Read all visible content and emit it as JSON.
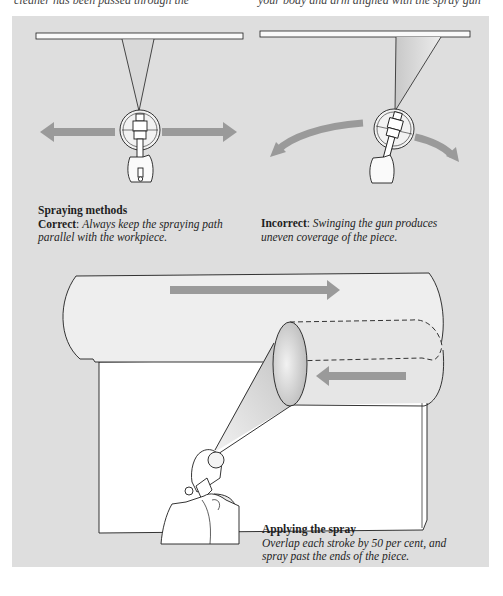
{
  "page_top": {
    "left_fragment": "cleaner has been passed through the",
    "right_fragment": "your body and arm aligned with the spray gun"
  },
  "colors": {
    "panel_bg": "#dedede",
    "arrow": "#9a9a9a",
    "outline": "#1e1e1e",
    "workpiece": "#f4f4f4"
  },
  "figures": {
    "correct": {
      "heading": "Spraying methods",
      "label": "Correct",
      "separator": ":",
      "text": "Always keep the spraying path parallel with the workpiece."
    },
    "incorrect": {
      "label": "Incorrect",
      "separator": ":",
      "text": "Swinging the gun produces uneven coverage of the piece."
    },
    "applying": {
      "heading": "Applying the spray",
      "text": "Overlap each stroke by 50 per cent, and spray past the ends of the piece."
    }
  }
}
